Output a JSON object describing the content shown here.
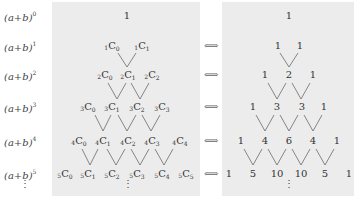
{
  "rows": [
    {
      "label": "(a+b)",
      "power": "0",
      "combos": [
        [
          "0",
          "0"
        ]
      ],
      "values": [
        "1"
      ]
    },
    {
      "label": "(a+b)",
      "power": "1",
      "combos": [
        [
          "1",
          "0"
        ],
        [
          "1",
          "1"
        ]
      ],
      "values": [
        "1",
        "1"
      ]
    },
    {
      "label": "(a+b)",
      "power": "2",
      "combos": [
        [
          "2",
          "0"
        ],
        [
          "2",
          "1"
        ],
        [
          "2",
          "2"
        ]
      ],
      "values": [
        "1",
        "2",
        "1"
      ]
    },
    {
      "label": "(a+b)",
      "power": "3",
      "combos": [
        [
          "3",
          "0"
        ],
        [
          "3",
          "1"
        ],
        [
          "3",
          "2"
        ],
        [
          "3",
          "3"
        ]
      ],
      "values": [
        "1",
        "3",
        "3",
        "1"
      ]
    },
    {
      "label": "(a+b)",
      "power": "4",
      "combos": [
        [
          "4",
          "0"
        ],
        [
          "4",
          "1"
        ],
        [
          "4",
          "2"
        ],
        [
          "4",
          "3"
        ],
        [
          "4",
          "4"
        ]
      ],
      "values": [
        "1",
        "4",
        "6",
        "4",
        "1"
      ]
    },
    {
      "label": "(a+b)",
      "power": "5",
      "combos": [
        [
          "5",
          "0"
        ],
        [
          "5",
          "1"
        ],
        [
          "5",
          "2"
        ],
        [
          "5",
          "3"
        ],
        [
          "5",
          "4"
        ],
        [
          "5",
          "5"
        ]
      ],
      "values": [
        "1",
        "5",
        "10",
        "10",
        "5",
        "1"
      ]
    }
  ],
  "combo_symbol": "C",
  "row0_left_text": "1",
  "arrow_symbol": "⟺",
  "ellipsis": "⋮",
  "colors": {
    "box_bg": "#ececec",
    "line": "#666666",
    "text": "#333333"
  }
}
